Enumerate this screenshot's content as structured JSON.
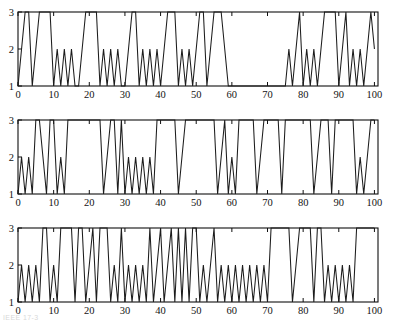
{
  "figure": {
    "background": "#ffffff",
    "line_color": "#1c1c1c",
    "axis_color": "#101010",
    "panel_count": 3,
    "footer_artifact": "IEEE 17-3"
  },
  "axes": {
    "x_ticks": [
      0,
      10,
      20,
      30,
      40,
      50,
      60,
      70,
      80,
      90,
      100
    ],
    "x_tick_labels": [
      "0",
      "10",
      "20",
      "30",
      "40",
      "50",
      "60",
      "70",
      "80",
      "90",
      "100"
    ],
    "y_ticks": [
      1,
      2,
      3
    ],
    "y_tick_labels": [
      "1",
      "2",
      "3"
    ],
    "xlim": [
      0,
      101
    ],
    "ylim": [
      1,
      3
    ],
    "xlabel": "",
    "ylabel": "",
    "grid": false
  },
  "chart_data": [
    {
      "type": "line",
      "title": "",
      "subtitle": "",
      "xlabel": "",
      "ylabel": "",
      "xlim": [
        0,
        101
      ],
      "ylim": [
        1,
        3
      ],
      "grid": false,
      "legend": [],
      "panel_index": 0,
      "x": [
        0,
        1,
        2,
        3,
        4,
        5,
        6,
        7,
        8,
        9,
        10,
        11,
        12,
        13,
        14,
        15,
        16,
        17,
        18,
        19,
        20,
        21,
        22,
        23,
        24,
        25,
        26,
        27,
        28,
        29,
        30,
        31,
        32,
        33,
        34,
        35,
        36,
        37,
        38,
        39,
        40,
        41,
        42,
        43,
        44,
        45,
        46,
        47,
        48,
        49,
        50,
        51,
        52,
        53,
        54,
        55,
        56,
        57,
        58,
        59,
        60,
        61,
        62,
        63,
        64,
        65,
        66,
        67,
        68,
        69,
        70,
        71,
        72,
        73,
        74,
        75,
        76,
        77,
        78,
        79,
        80,
        81,
        82,
        83,
        84,
        85,
        86,
        87,
        88,
        89,
        90,
        91,
        92,
        93,
        94,
        95,
        96,
        97,
        98,
        99,
        100
      ],
      "series": [
        {
          "name": "state",
          "values": [
            1,
            2,
            3,
            3,
            1,
            2,
            3,
            3,
            3,
            3,
            1,
            2,
            1,
            2,
            1,
            2,
            1,
            1,
            2,
            3,
            3,
            3,
            3,
            1,
            2,
            1,
            2,
            1,
            2,
            1,
            1,
            2,
            3,
            3,
            1,
            2,
            1,
            2,
            1,
            2,
            1,
            2,
            3,
            3,
            3,
            1,
            2,
            1,
            2,
            1,
            2,
            3,
            3,
            1,
            2,
            3,
            3,
            3,
            2,
            1,
            1,
            1,
            1,
            1,
            1,
            1,
            1,
            1,
            1,
            1,
            1,
            1,
            1,
            1,
            1,
            1,
            2,
            1,
            2,
            3,
            1,
            2,
            1,
            2,
            1,
            2,
            3,
            3,
            3,
            3,
            1,
            2,
            3,
            1,
            2,
            1,
            2,
            1,
            2,
            3,
            2
          ]
        }
      ]
    },
    {
      "type": "line",
      "title": "",
      "subtitle": "",
      "xlabel": "",
      "ylabel": "",
      "xlim": [
        0,
        101
      ],
      "ylim": [
        1,
        3
      ],
      "grid": false,
      "legend": [],
      "panel_index": 1,
      "x": [
        0,
        1,
        2,
        3,
        4,
        5,
        6,
        7,
        8,
        9,
        10,
        11,
        12,
        13,
        14,
        15,
        16,
        17,
        18,
        19,
        20,
        21,
        22,
        23,
        24,
        25,
        26,
        27,
        28,
        29,
        30,
        31,
        32,
        33,
        34,
        35,
        36,
        37,
        38,
        39,
        40,
        41,
        42,
        43,
        44,
        45,
        46,
        47,
        48,
        49,
        50,
        51,
        52,
        53,
        54,
        55,
        56,
        57,
        58,
        59,
        60,
        61,
        62,
        63,
        64,
        65,
        66,
        67,
        68,
        69,
        70,
        71,
        72,
        73,
        74,
        75,
        76,
        77,
        78,
        79,
        80,
        81,
        82,
        83,
        84,
        85,
        86,
        87,
        88,
        89,
        90,
        91,
        92,
        93,
        94,
        95,
        96,
        97,
        98,
        99,
        100
      ],
      "series": [
        {
          "name": "state",
          "values": [
            1,
            2,
            1,
            2,
            1,
            3,
            3,
            2,
            1,
            3,
            3,
            1,
            2,
            1,
            3,
            3,
            3,
            3,
            3,
            3,
            3,
            3,
            3,
            3,
            1,
            2,
            3,
            3,
            1,
            3,
            1,
            2,
            1,
            2,
            1,
            2,
            1,
            2,
            1,
            3,
            3,
            3,
            3,
            3,
            3,
            1,
            2,
            3,
            3,
            3,
            3,
            3,
            3,
            3,
            3,
            3,
            1,
            2,
            3,
            1,
            2,
            1,
            3,
            3,
            3,
            3,
            3,
            1,
            2,
            3,
            3,
            3,
            3,
            3,
            1,
            3,
            3,
            3,
            3,
            3,
            3,
            3,
            3,
            1,
            2,
            3,
            3,
            3,
            1,
            3,
            3,
            3,
            3,
            3,
            3,
            1,
            2,
            1,
            2,
            3,
            3
          ]
        }
      ]
    },
    {
      "type": "line",
      "title": "",
      "subtitle": "",
      "xlabel": "",
      "ylabel": "",
      "xlim": [
        0,
        101
      ],
      "ylim": [
        1,
        3
      ],
      "grid": false,
      "legend": [],
      "panel_index": 2,
      "x": [
        0,
        1,
        2,
        3,
        4,
        5,
        6,
        7,
        8,
        9,
        10,
        11,
        12,
        13,
        14,
        15,
        16,
        17,
        18,
        19,
        20,
        21,
        22,
        23,
        24,
        25,
        26,
        27,
        28,
        29,
        30,
        31,
        32,
        33,
        34,
        35,
        36,
        37,
        38,
        39,
        40,
        41,
        42,
        43,
        44,
        45,
        46,
        47,
        48,
        49,
        50,
        51,
        52,
        53,
        54,
        55,
        56,
        57,
        58,
        59,
        60,
        61,
        62,
        63,
        64,
        65,
        66,
        67,
        68,
        69,
        70,
        71,
        72,
        73,
        74,
        75,
        76,
        77,
        78,
        79,
        80,
        81,
        82,
        83,
        84,
        85,
        86,
        87,
        88,
        89,
        90,
        91,
        92,
        93,
        94,
        95,
        96,
        97,
        98,
        99,
        100
      ],
      "series": [
        {
          "name": "state",
          "values": [
            1,
            2,
            1,
            2,
            1,
            2,
            1,
            3,
            3,
            1,
            2,
            1,
            3,
            3,
            3,
            3,
            1,
            3,
            3,
            1,
            2,
            3,
            1,
            3,
            3,
            3,
            1,
            2,
            1,
            3,
            1,
            2,
            1,
            2,
            1,
            2,
            1,
            3,
            1,
            2,
            3,
            1,
            2,
            3,
            1,
            3,
            1,
            3,
            1,
            3,
            3,
            1,
            2,
            1,
            2,
            3,
            1,
            2,
            1,
            2,
            1,
            2,
            1,
            2,
            1,
            2,
            1,
            2,
            1,
            2,
            1,
            3,
            3,
            3,
            3,
            3,
            3,
            1,
            2,
            3,
            3,
            3,
            3,
            1,
            3,
            3,
            1,
            2,
            1,
            2,
            1,
            2,
            1,
            2,
            1,
            3,
            3,
            3,
            3,
            3,
            3
          ]
        }
      ]
    }
  ]
}
